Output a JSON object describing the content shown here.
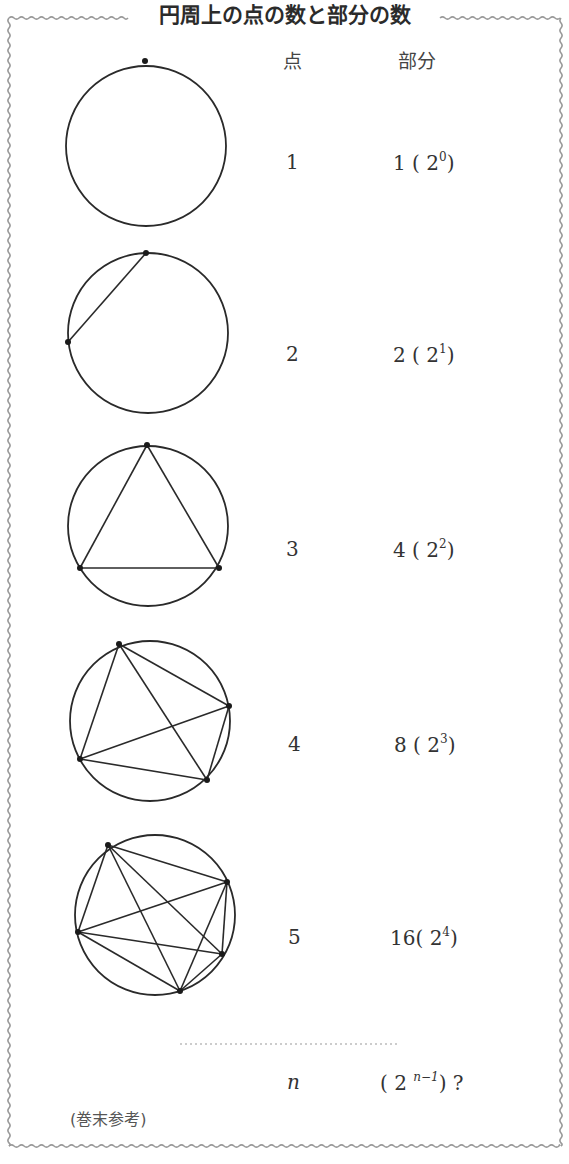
{
  "title": "円周上の点の数と部分の数",
  "headers": {
    "points": "点",
    "regions": "部分"
  },
  "rows": [
    {
      "points": "1",
      "regions": "1",
      "power_base": "2",
      "exponent": "0"
    },
    {
      "points": "2",
      "regions": "2",
      "power_base": "2",
      "exponent": "1"
    },
    {
      "points": "3",
      "regions": "4",
      "power_base": "2",
      "exponent": "2"
    },
    {
      "points": "4",
      "regions": "8",
      "power_base": "2",
      "exponent": "3"
    },
    {
      "points": "5",
      "regions": "16",
      "power_base": "2",
      "exponent": "4"
    }
  ],
  "general": {
    "points": "n",
    "power_base": "2",
    "exponent": "n−1",
    "question": "?"
  },
  "note": "(巻末参考)",
  "colors": {
    "line": "#2a2a2a",
    "border": "#9a9a9a",
    "text": "#333333"
  },
  "circles": [
    {
      "cx": 146,
      "cy": 146,
      "r": 80,
      "points": [
        [
          145,
          61
        ]
      ]
    },
    {
      "cx": 148,
      "cy": 333,
      "r": 80,
      "points": [
        [
          146,
          253
        ],
        [
          68,
          342
        ]
      ]
    },
    {
      "cx": 148,
      "cy": 526,
      "r": 80,
      "points": [
        [
          147,
          445
        ],
        [
          80,
          568
        ],
        [
          219,
          568
        ]
      ]
    },
    {
      "cx": 150,
      "cy": 721,
      "r": 80,
      "points": [
        [
          119,
          644
        ],
        [
          229,
          706
        ],
        [
          80,
          759
        ],
        [
          207,
          780
        ]
      ]
    },
    {
      "cx": 155,
      "cy": 915,
      "r": 80,
      "points": [
        [
          108,
          845
        ],
        [
          227,
          882
        ],
        [
          78,
          932
        ],
        [
          222,
          954
        ],
        [
          180,
          991
        ]
      ]
    }
  ]
}
